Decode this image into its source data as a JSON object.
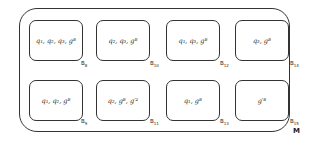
{
  "diagram": {
    "container_label": "M",
    "boxes": [
      {
        "id": "B8",
        "label_base": "B",
        "label_sub": "8",
        "contents": "q₁, q₂, q₃, gᴮ"
      },
      {
        "id": "B10",
        "label_base": "B",
        "label_sub": "10",
        "contents": "q₂, q₃, gᴮ"
      },
      {
        "id": "B12",
        "label_base": "B",
        "label_sub": "12",
        "contents": "q₁, q₃, gᴮ"
      },
      {
        "id": "B14",
        "label_base": "B",
        "label_sub": "14",
        "contents": "q₃, gᴮ"
      },
      {
        "id": "B9",
        "label_base": "B",
        "label_sub": "9",
        "contents": "q₁, q₂, gᴮ"
      },
      {
        "id": "B11",
        "label_base": "B",
        "label_sub": "11",
        "contents": "q₂, gᴮ, g′²"
      },
      {
        "id": "B13",
        "label_base": "B",
        "label_sub": "13",
        "contents": "q₁, gᴮ"
      },
      {
        "id": "B15",
        "label_base": "B",
        "label_sub": "15",
        "contents": "g′ᴮ"
      }
    ]
  }
}
